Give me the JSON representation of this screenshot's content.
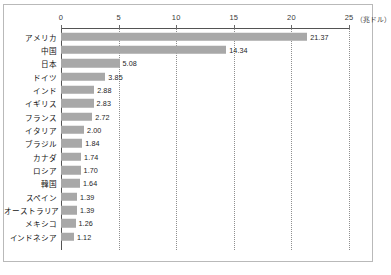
{
  "chart_data": {
    "type": "bar",
    "orientation": "horizontal",
    "title": "",
    "xlabel": "",
    "ylabel": "",
    "unit_label": "（兆ドル）",
    "xlim": [
      0,
      25
    ],
    "xticks": [
      "0",
      "5",
      "10",
      "15",
      "20",
      "25"
    ],
    "xtick_values": [
      0,
      5,
      10,
      15,
      20,
      25
    ],
    "grid": true,
    "legend": false,
    "bar_color": "#a8a8a8",
    "categories": [
      "アメリカ",
      "中国",
      "日本",
      "ドイツ",
      "インド",
      "イギリス",
      "フランス",
      "イタリア",
      "ブラジル",
      "カナダ",
      "ロシア",
      "韓国",
      "スペイン",
      "オーストラリア",
      "メキシコ",
      "インドネシア"
    ],
    "values": [
      21.37,
      14.34,
      5.08,
      3.85,
      2.88,
      2.83,
      2.72,
      2.0,
      1.84,
      1.74,
      1.7,
      1.64,
      1.39,
      1.39,
      1.26,
      1.12
    ],
    "value_labels": [
      "21.37",
      "14.34",
      "5.08",
      "3.85",
      "2.88",
      "2.83",
      "2.72",
      "2.00",
      "1.84",
      "1.74",
      "1.70",
      "1.64",
      "1.39",
      "1.39",
      "1.26",
      "1.12"
    ]
  },
  "footer": {
    "note": ""
  }
}
